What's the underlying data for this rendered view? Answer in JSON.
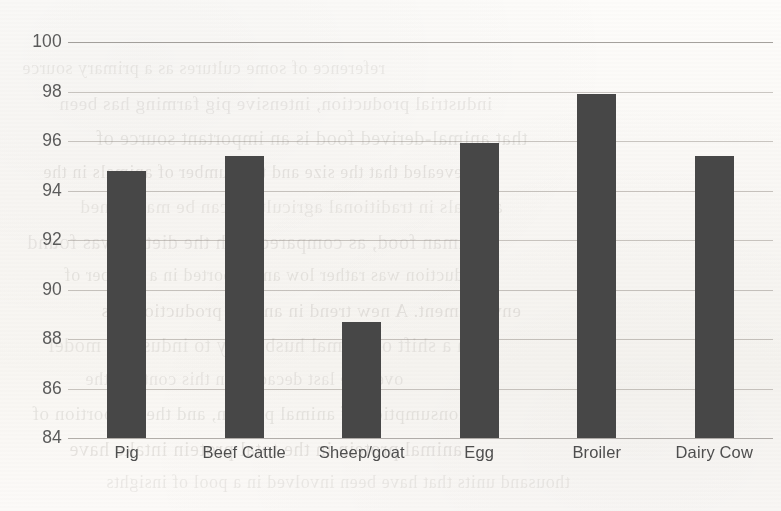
{
  "chart_data": {
    "type": "bar",
    "title": "",
    "subtitle": "",
    "xlabel": "",
    "ylabel": "",
    "categories": [
      "Pig",
      "Beef Cattle",
      "Sheep/goat",
      "Egg",
      "Broiler",
      "Dairy Cow"
    ],
    "values": [
      94.8,
      95.4,
      88.7,
      95.9,
      97.9,
      95.4
    ],
    "series": [
      {
        "name": "",
        "values": [
          94.8,
          95.4,
          88.7,
          95.9,
          97.9,
          95.4
        ]
      }
    ],
    "ylim": [
      84,
      100
    ],
    "yticks": [
      84,
      86,
      88,
      90,
      92,
      94,
      96,
      98,
      100
    ],
    "ytick_labels": [
      "84",
      "86",
      "88",
      "90",
      "92",
      "94",
      "96",
      "98",
      "100"
    ],
    "grid": true,
    "grid_axis": "y",
    "legend": false,
    "legend_position": "none",
    "bar_color": "#474747",
    "gridline_color": "#78726a",
    "tick_label_color": "#5b5b5b",
    "background_color": "#fbfaf8",
    "annotations": []
  },
  "page": {
    "ghost_text": [
      "reference of some cultures as a primary source",
      "industrial production, intensive pig farming has been",
      "that animal-derived food is an important source of",
      "revealed that the size and the number of animals in the",
      "animals in traditional agriculture can be maintained",
      "human food, as compared with the diet. It was found",
      "production was rather low and reported in a number of",
      "environment. A new trend in animal production has",
      "been a shift of animal husbandry to industrial model",
      "over the last decades. In this context, the",
      "consumption of animal protein, and the proportion of",
      "animal protein in the total protein intake have",
      "thousand units that have been involved in a pool of insights"
    ]
  }
}
